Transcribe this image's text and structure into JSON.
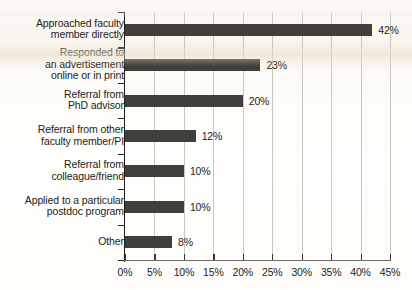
{
  "chart_data": {
    "type": "bar",
    "orientation": "horizontal",
    "title": "",
    "subtitle": "",
    "xlabel": "",
    "ylabel": "",
    "xlim": [
      0,
      45
    ],
    "grid": true,
    "legend": false,
    "legend_position": "none",
    "bar_color": "#413f3b",
    "gridline_color": "#c9c7c2",
    "axis_color": "#1d1c1a",
    "background_color": "#fdfcfa",
    "categories": [
      "Approached faculty\nmember directly",
      "Responded to\nan advertisement\nonline or in print",
      "Referral from\nPhD advisor",
      "Referral from other\nfaculty member/PI",
      "Referral from\ncolleague/friend",
      "Applied to a particular\npostdoc program",
      "Other"
    ],
    "values": [
      42,
      23,
      20,
      12,
      10,
      10,
      8
    ],
    "value_labels": [
      "42%",
      "23%",
      "20%",
      "12%",
      "10%",
      "10%",
      "8%"
    ],
    "xticks": [
      0,
      5,
      10,
      15,
      20,
      25,
      30,
      35,
      40,
      45
    ],
    "xtick_labels": [
      "0%",
      "5%",
      "10%",
      "15%",
      "20%",
      "25%",
      "30%",
      "35%",
      "40%",
      "45%"
    ]
  }
}
